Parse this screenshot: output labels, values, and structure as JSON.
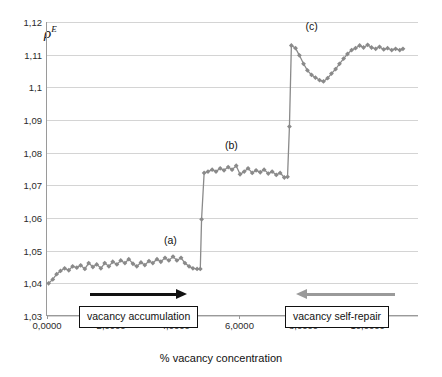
{
  "chart_data": {
    "type": "line",
    "title": "",
    "xlabel": "% vacancy concentration",
    "ylabel": "ρ",
    "ylabel_sup": "E",
    "xlim": [
      0,
      11.6
    ],
    "ylim": [
      1.03,
      1.12
    ],
    "grid": true,
    "legend": null,
    "yticks": [
      "1,03",
      "1,04",
      "1,05",
      "1,06",
      "1,07",
      "1,08",
      "1,09",
      "1,1",
      "1,11",
      "1,12"
    ],
    "ytick_values": [
      1.03,
      1.04,
      1.05,
      1.06,
      1.07,
      1.08,
      1.09,
      1.1,
      1.11,
      1.12
    ],
    "xticks": [
      "0,0000",
      "2,0000",
      "4,0000",
      "6,0000",
      "8,0000",
      "10,0000"
    ],
    "xtick_values": [
      0,
      2,
      4,
      6,
      8,
      10
    ],
    "series": [
      {
        "name": "rho_E",
        "marker": "diamond",
        "color": "#8a8a8a",
        "line_color": "#8a8a8a",
        "x": [
          0.05,
          0.18,
          0.3,
          0.42,
          0.55,
          0.68,
          0.8,
          0.93,
          1.05,
          1.18,
          1.3,
          1.43,
          1.55,
          1.68,
          1.8,
          1.93,
          2.05,
          2.18,
          2.3,
          2.43,
          2.55,
          2.68,
          2.8,
          2.93,
          3.05,
          3.18,
          3.3,
          3.43,
          3.55,
          3.68,
          3.8,
          3.93,
          4.05,
          4.18,
          4.3,
          4.43,
          4.55,
          4.68,
          4.78,
          4.82,
          4.9,
          5.02,
          5.15,
          5.27,
          5.4,
          5.52,
          5.65,
          5.77,
          5.9,
          6.02,
          6.15,
          6.27,
          6.4,
          6.52,
          6.65,
          6.77,
          6.9,
          7.02,
          7.15,
          7.27,
          7.4,
          7.5,
          7.56,
          7.62,
          7.75,
          7.87,
          8.0,
          8.12,
          8.25,
          8.37,
          8.5,
          8.62,
          8.75,
          8.87,
          9.0,
          9.12,
          9.25,
          9.37,
          9.5,
          9.62,
          9.75,
          9.87,
          10.0,
          10.12,
          10.25,
          10.37,
          10.5,
          10.62,
          10.75,
          10.87,
          11.0,
          11.1
        ],
        "y": [
          1.04,
          1.0412,
          1.0428,
          1.0438,
          1.0446,
          1.044,
          1.0452,
          1.0448,
          1.0455,
          1.0444,
          1.0462,
          1.045,
          1.0458,
          1.0446,
          1.0462,
          1.0452,
          1.0466,
          1.0458,
          1.047,
          1.0462,
          1.0474,
          1.046,
          1.0452,
          1.0464,
          1.0456,
          1.0468,
          1.0462,
          1.0474,
          1.0466,
          1.0478,
          1.047,
          1.0482,
          1.047,
          1.0478,
          1.0462,
          1.0452,
          1.0446,
          1.0444,
          1.0444,
          1.0596,
          1.0738,
          1.0742,
          1.0748,
          1.0742,
          1.0752,
          1.0746,
          1.0756,
          1.0748,
          1.076,
          1.0734,
          1.0742,
          1.0752,
          1.0738,
          1.0746,
          1.074,
          1.0748,
          1.0736,
          1.0742,
          1.0732,
          1.0738,
          1.0724,
          1.0726,
          1.088,
          1.1128,
          1.112,
          1.1098,
          1.1072,
          1.1052,
          1.1038,
          1.103,
          1.1022,
          1.1018,
          1.1028,
          1.1042,
          1.1056,
          1.1072,
          1.1088,
          1.1102,
          1.1114,
          1.112,
          1.1128,
          1.1122,
          1.113,
          1.1122,
          1.1118,
          1.1124,
          1.1116,
          1.112,
          1.1114,
          1.1118,
          1.1114,
          1.1118
        ]
      }
    ],
    "annotations": [
      {
        "id": "a",
        "text": "(a)",
        "x": 3.85,
        "y": 1.0508
      },
      {
        "id": "b",
        "text": "(b)",
        "x": 5.75,
        "y": 1.08
      },
      {
        "id": "c",
        "text": "(c)",
        "x": 8.25,
        "y": 1.1162
      }
    ],
    "callouts": [
      {
        "id": "accumulation",
        "text": "vacancy accumulation",
        "arrow": "right",
        "arrow_color": "#111111"
      },
      {
        "id": "self-repair",
        "text": "vacancy self-repair",
        "arrow": "left",
        "arrow_color": "#9a9a9a"
      }
    ]
  }
}
